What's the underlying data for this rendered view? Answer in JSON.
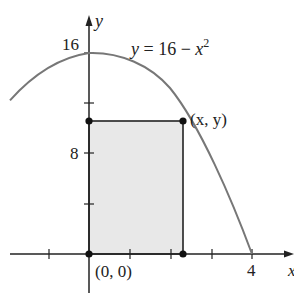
{
  "diagram": {
    "type": "function-plot-with-inscribed-rectangle",
    "function_label": {
      "lhs": "y",
      "eq": " = 16 − ",
      "var": "x",
      "exp": "2"
    },
    "curve": {
      "equation": "y = 16 - x^2",
      "x_range": [
        -1.94,
        4
      ],
      "stroke": "#777777"
    },
    "axes": {
      "x_label": "x",
      "y_label": "y",
      "x_ticks": [
        -1,
        0,
        1,
        2,
        3,
        4
      ],
      "y_ticks": [
        4,
        8,
        12,
        16
      ],
      "x_tick_labels": [
        {
          "value": 4,
          "text": "4"
        }
      ],
      "y_tick_labels": [
        {
          "value": 16,
          "text": "16"
        },
        {
          "value": 8,
          "text": "8"
        }
      ]
    },
    "rectangle": {
      "corners": [
        [
          0,
          0
        ],
        [
          2.31,
          0
        ],
        [
          2.31,
          10.67
        ],
        [
          0,
          10.67
        ]
      ],
      "fill": "#e8e8e8",
      "stroke": "#222222"
    },
    "points": [
      {
        "name": "origin",
        "coords": [
          0,
          0
        ],
        "label": "(0, 0)"
      },
      {
        "name": "curve-point",
        "coords": [
          2.31,
          10.67
        ],
        "label": "(x, y)"
      },
      {
        "name": "rect-top-left",
        "coords": [
          0,
          10.67
        ],
        "label": ""
      },
      {
        "name": "rect-bottom-right",
        "coords": [
          2.31,
          0
        ],
        "label": ""
      }
    ],
    "labels": {
      "y_tick_16": "16",
      "y_tick_8": "8",
      "x_tick_4": "4",
      "origin": "(0, 0)",
      "point_xy": "(x, y)",
      "x_axis": "x",
      "y_axis": "y"
    }
  }
}
